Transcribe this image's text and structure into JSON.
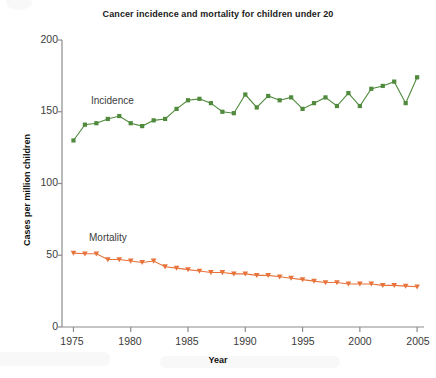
{
  "chart_data": {
    "type": "line",
    "title": "Cancer incidence and mortality for children under 20",
    "xlabel": "Year",
    "ylabel": "Cases per million children",
    "xlim": [
      1974,
      2005.6
    ],
    "ylim": [
      0,
      200
    ],
    "xticks": [
      1975,
      1980,
      1985,
      1990,
      1995,
      2000,
      2005
    ],
    "yticks": [
      0,
      50,
      100,
      150,
      200
    ],
    "grid": false,
    "legend_position": "inline-annotation",
    "x": [
      1975,
      1976,
      1977,
      1978,
      1979,
      1980,
      1981,
      1982,
      1983,
      1984,
      1985,
      1986,
      1987,
      1988,
      1989,
      1990,
      1991,
      1992,
      1993,
      1994,
      1995,
      1996,
      1997,
      1998,
      1999,
      2000,
      2001,
      2002,
      2003,
      2004,
      2005
    ],
    "series": [
      {
        "name": "Incidence",
        "color": "#4f8a3d",
        "marker": "square",
        "values": [
          130,
          141,
          142,
          145,
          147,
          142,
          140,
          144,
          145,
          152,
          158,
          159,
          156,
          150,
          149,
          162,
          153,
          161,
          158,
          160,
          152,
          156,
          160,
          154,
          163,
          154,
          166,
          168,
          171,
          156,
          174
        ]
      },
      {
        "name": "Mortality",
        "color": "#e8733a",
        "marker": "triangle-down",
        "values": [
          51.5,
          51,
          51,
          47,
          47,
          46,
          45,
          46,
          42,
          41,
          40,
          39,
          38,
          38,
          37,
          37,
          36,
          36,
          35,
          34,
          33,
          32,
          31,
          31,
          30,
          30,
          30,
          29,
          29,
          28.5,
          28
        ]
      }
    ],
    "annotations": [
      {
        "text": "Incidence",
        "x": 1977.6,
        "y": 157
      },
      {
        "text": "Mortality",
        "x": 1977.2,
        "y": 61
      }
    ]
  },
  "axis": {
    "ytick_labels": [
      "200",
      "150",
      "100",
      "50",
      "0"
    ],
    "xtick_labels": [
      "1975",
      "1980",
      "1985",
      "1990",
      "1995",
      "2000",
      "2005"
    ]
  }
}
